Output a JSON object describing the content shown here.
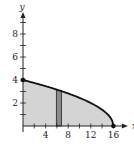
{
  "chart_data": {
    "type": "area",
    "title": "",
    "xlabel": "x",
    "ylabel": "y",
    "xlim": [
      0,
      17.5
    ],
    "ylim": [
      0,
      9.3
    ],
    "x_ticks": [
      2,
      4,
      6,
      8,
      10,
      12,
      14,
      16
    ],
    "x_tick_labels": [
      "4",
      "8",
      "12",
      "16"
    ],
    "x_labeled_values": [
      4,
      8,
      12,
      16
    ],
    "y_ticks": [
      1,
      2,
      3,
      4,
      5,
      6,
      7,
      8,
      9
    ],
    "y_tick_labels": [
      "2",
      "4",
      "6",
      "8"
    ],
    "y_labeled_values": [
      2,
      4,
      6,
      8
    ],
    "grid": false,
    "curve": {
      "description": "y = sqrt(16 - x)",
      "x": [
        0,
        2,
        4,
        6,
        8,
        10,
        12,
        14,
        15,
        15.5,
        16
      ],
      "y": [
        4,
        3.742,
        3.464,
        3.162,
        2.828,
        2.449,
        2,
        1.414,
        1,
        0.707,
        0
      ]
    },
    "endpoints": [
      {
        "x": 0,
        "y": 4
      },
      {
        "x": 16,
        "y": 0
      }
    ],
    "shaded_region": {
      "from_x": 0,
      "to_x": 16,
      "between": "curve and x-axis"
    },
    "representative_rectangle": {
      "x_start": 5.9,
      "x_end": 6.8,
      "height": 3.1
    },
    "colors": {
      "region_fill": "#d4d4d4",
      "rectangle_fill": "#8a8a8a",
      "curve": "#111111",
      "axis": "#222222"
    }
  }
}
